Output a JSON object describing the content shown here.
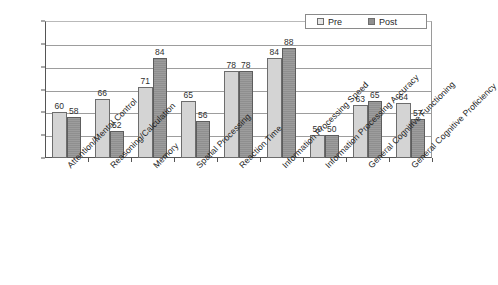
{
  "chart_data": {
    "type": "bar",
    "title": "",
    "xlabel": "",
    "ylabel": "",
    "ylim": [
      40,
      100
    ],
    "yticks": [
      40,
      50,
      60,
      70,
      80,
      90,
      100
    ],
    "grid": true,
    "legend_position": "top-right-inside",
    "categories": [
      "Attention/Mental Control",
      "Reasoning/Calculation",
      "Memory",
      "Spatial Processing",
      "Reaction Time",
      "Information Processing Speed",
      "Information Processing Accuracy",
      "General Cognitive Functioning",
      "General Cognitive Proficiency"
    ],
    "series": [
      {
        "name": "Pre",
        "color": "#d4d4d4",
        "values": [
          60,
          66,
          71,
          65,
          78,
          84,
          50,
          63,
          64
        ]
      },
      {
        "name": "Post",
        "color": "#8f8f8f",
        "values": [
          58,
          52,
          84,
          56,
          78,
          88,
          50,
          65,
          57
        ]
      }
    ]
  }
}
